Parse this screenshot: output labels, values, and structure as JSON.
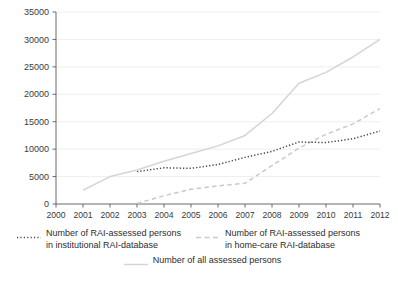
{
  "chart_data": {
    "type": "line",
    "title": "",
    "xlabel": "",
    "ylabel": "",
    "x": [
      2000,
      2001,
      2002,
      2003,
      2004,
      2005,
      2006,
      2007,
      2008,
      2009,
      2010,
      2011,
      2012
    ],
    "xticklabels": [
      "2000",
      "2001",
      "2002",
      "2003",
      "2004",
      "2005",
      "2006",
      "2007",
      "2008",
      "2009",
      "2010",
      "2011",
      "2012"
    ],
    "yticklabels": [
      "0",
      "5000",
      "10000",
      "15000",
      "20000",
      "25000",
      "30000",
      "35000"
    ],
    "yticks": [
      0,
      5000,
      10000,
      15000,
      20000,
      25000,
      30000,
      35000
    ],
    "ylim": [
      0,
      35000
    ],
    "xlim": [
      2000,
      2012
    ],
    "grid": "horizontal",
    "legend_position": "below",
    "series": [
      {
        "name": "Number of RAI-assessed persons in institutional RAI-database",
        "name_line1": "Number of RAI-assessed persons",
        "name_line2": "in institutional RAI-database",
        "style": "dotted",
        "color": "#4a4a4a",
        "x": [
          2003,
          2004,
          2005,
          2006,
          2007,
          2008,
          2009,
          2010,
          2011,
          2012
        ],
        "values": [
          5900,
          6600,
          6500,
          7200,
          8500,
          9600,
          11300,
          11200,
          11900,
          13300
        ]
      },
      {
        "name": "Number of RAI-assessed persons in home-care RAI-database",
        "name_line1": "Number of RAI-assessed persons",
        "name_line2": "in home-care RAI-database",
        "style": "dashed",
        "color": "#c9c9c9",
        "x": [
          2003,
          2004,
          2005,
          2006,
          2007,
          2008,
          2009,
          2010,
          2011,
          2012
        ],
        "values": [
          100,
          1500,
          2700,
          3300,
          3800,
          7000,
          10200,
          12700,
          14600,
          17400
        ]
      },
      {
        "name": "Number of all assessed persons",
        "name_line1": "Number of all assessed persons",
        "name_line2": "",
        "style": "solid",
        "color": "#d5d5d5",
        "x": [
          2001,
          2002,
          2003,
          2004,
          2005,
          2006,
          2007,
          2008,
          2009,
          2010,
          2011,
          2012
        ],
        "values": [
          2500,
          5000,
          6200,
          7800,
          9200,
          10600,
          12500,
          16500,
          22000,
          24000,
          26800,
          30000
        ]
      }
    ],
    "axis_color": "#5a5a5a",
    "grid_color": "#eaeaea",
    "background": "#ffffff"
  },
  "legend": {
    "entry1_line1": "Number of RAI-assessed persons",
    "entry1_line2": "in institutional RAI-database",
    "entry2_line1": "Number of RAI-assessed persons",
    "entry2_line2": "in home-care RAI-database",
    "entry3_line1": "Number of all assessed persons"
  }
}
